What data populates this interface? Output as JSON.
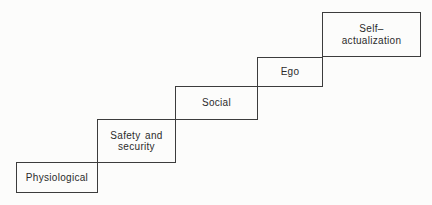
{
  "diagram": {
    "type": "staircase-hierarchy",
    "steps": [
      {
        "label": "Physiological"
      },
      {
        "label": "Safety and\nsecurity"
      },
      {
        "label": "Social"
      },
      {
        "label": "Ego"
      },
      {
        "label": "Self–\nactualization"
      }
    ],
    "colors": {
      "line": "#3c3c3c",
      "background": "#fcfcfb",
      "text": "#2b2b2b"
    }
  }
}
